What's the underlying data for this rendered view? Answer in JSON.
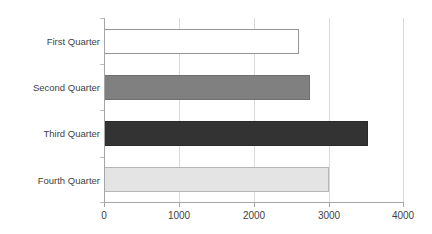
{
  "chart_data": {
    "type": "bar",
    "orientation": "horizontal",
    "title": "",
    "xlabel": "",
    "ylabel": "",
    "categories": [
      "First Quarter",
      "Second Quarter",
      "Third Quarter",
      "Fourth Quarter"
    ],
    "values": [
      2600,
      2750,
      3520,
      3000
    ],
    "xlim": [
      0,
      4000
    ],
    "xticks": [
      0,
      1000,
      2000,
      3000,
      4000
    ],
    "xtick_labels": [
      "0",
      "1000",
      "2000",
      "3000",
      "4000"
    ],
    "grid": "vertical",
    "legend": "none",
    "series": [
      {
        "name": "Series 1",
        "values": [
          2600,
          2750,
          3520,
          3000
        ],
        "colors": [
          "#ffffff",
          "#808080",
          "#333333",
          "#e4e4e4"
        ],
        "border_colors": [
          "#959595",
          "#6f6f6f",
          "#2b2b2b",
          "#b6b6b6"
        ]
      }
    ],
    "colors": {
      "axis": "#a6a6a6",
      "gridline": "#d9d9d9",
      "text": "#3f3f3f",
      "background": "#ffffff",
      "bar_first_quarter": "#ffffff",
      "bar_second_quarter": "#808080",
      "bar_third_quarter": "#333333",
      "bar_fourth_quarter": "#e4e4e4"
    }
  }
}
